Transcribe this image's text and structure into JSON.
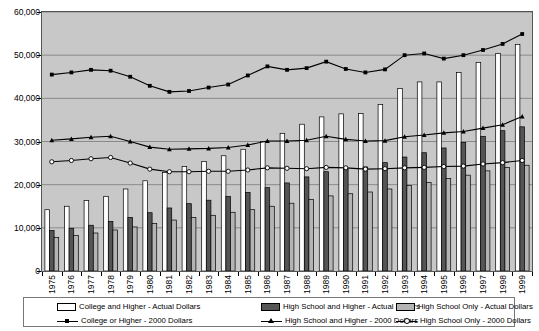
{
  "chart_data": {
    "type": "bar",
    "title": "",
    "xlabel": "",
    "ylabel": "",
    "ylim": [
      0,
      60000
    ],
    "ytick_values": [
      0,
      10000,
      20000,
      30000,
      40000,
      50000,
      60000
    ],
    "ytick_labels": [
      "0",
      "10,000",
      "20,000",
      "30,000",
      "40,000",
      "50,000",
      "60,000"
    ],
    "grid": true,
    "legend_position": "bottom",
    "categories": [
      "1975",
      "1976",
      "1977",
      "1978",
      "1979",
      "1980",
      "1981",
      "1982",
      "1983",
      "1984",
      "1985",
      "1986",
      "1987",
      "1988",
      "1989",
      "1990",
      "1991",
      "1992",
      "1993",
      "1994",
      "1995",
      "1996",
      "1997",
      "1998",
      "1999"
    ],
    "bar_series": [
      {
        "name": "College and Higher - Actual Dollars",
        "color": "#ffffff",
        "values": [
          14200,
          15000,
          16300,
          17300,
          19000,
          20900,
          22800,
          24200,
          25400,
          26700,
          28200,
          30000,
          31900,
          34000,
          35700,
          36400,
          36500,
          38600,
          42300,
          43800,
          43800,
          46000,
          48300,
          50400,
          52500
        ]
      },
      {
        "name": "High School and Higher - Actual Dollars",
        "color": "#555555",
        "values": [
          9400,
          9900,
          10600,
          11500,
          12400,
          13500,
          14600,
          15600,
          16400,
          17300,
          18200,
          19300,
          20400,
          21800,
          23000,
          23600,
          24100,
          25100,
          26400,
          27400,
          28500,
          29800,
          31200,
          32500,
          33400
        ]
      },
      {
        "name": "High School Only - Actual Dollars",
        "color": "#b4b4b4",
        "values": [
          7800,
          8200,
          8800,
          9500,
          10200,
          11000,
          11800,
          12400,
          12900,
          13600,
          14200,
          15000,
          15700,
          16600,
          17400,
          17900,
          18300,
          19000,
          19800,
          20500,
          21400,
          22200,
          23200,
          24000,
          24500
        ]
      }
    ],
    "line_series": [
      {
        "name": "College or Higher - 2000 Dollars",
        "marker": "filled-square",
        "color": "#000000",
        "values": [
          45500,
          46000,
          46600,
          46400,
          45000,
          42900,
          41500,
          41700,
          42500,
          43200,
          45300,
          47400,
          46600,
          47000,
          48500,
          46800,
          46000,
          46700,
          50000,
          50400,
          49200,
          50000,
          51200,
          52600,
          54900
        ]
      },
      {
        "name": "High School and Higher - 2000 Dollars",
        "marker": "filled-triangle",
        "color": "#000000",
        "values": [
          30300,
          30600,
          31000,
          31200,
          30000,
          28700,
          28200,
          28300,
          28400,
          28600,
          29200,
          30100,
          30100,
          30300,
          31200,
          30500,
          30100,
          30200,
          31100,
          31500,
          32000,
          32300,
          33100,
          33900,
          35800
        ]
      },
      {
        "name": "High School Only - 2000 Dollars",
        "marker": "open-circle",
        "color": "#000000",
        "values": [
          25300,
          25600,
          26000,
          26300,
          25000,
          23600,
          23000,
          23000,
          23100,
          23100,
          23400,
          23900,
          23800,
          23700,
          24000,
          23900,
          23600,
          23700,
          23900,
          24000,
          24200,
          24300,
          24800,
          25100,
          25600
        ]
      }
    ]
  },
  "legend": {
    "entries": [
      {
        "label": "College and Higher - Actual Dollars",
        "type": "bar",
        "swatch": "white-bar-swatch"
      },
      {
        "label": "High School and Higher - Actual Dollars",
        "type": "bar",
        "swatch": "dark-bar-swatch"
      },
      {
        "label": "High School Only - Actual Dollars",
        "type": "bar",
        "swatch": "light-bar-swatch"
      },
      {
        "label": "College or Higher - 2000 Dollars",
        "type": "line",
        "swatch": "square-marker-line-swatch"
      },
      {
        "label": "High School and Higher - 2000 Dollars",
        "type": "line",
        "swatch": "triangle-marker-line-swatch"
      },
      {
        "label": "High School Only - 2000 Dollars",
        "type": "line",
        "swatch": "circle-marker-line-swatch"
      }
    ]
  },
  "colors": {
    "plot_background": "#c8c8c8",
    "grid": "#8a8a8a",
    "bar_white": "#ffffff",
    "bar_dark": "#555555",
    "bar_light": "#b4b4b4",
    "line": "#000000"
  }
}
